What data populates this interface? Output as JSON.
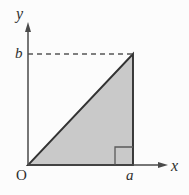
{
  "figure": {
    "kind": "right-triangle-coordinate-diagram",
    "background_color": "#fcfcfc",
    "labels": {
      "y_axis": "y",
      "x_axis": "x",
      "origin": "O",
      "height_tick": "b",
      "base_tick": "a"
    },
    "colors": {
      "axis": "#4a4a4a",
      "outline": "#333333",
      "fill": "#c9c9c9",
      "dashed": "#555555",
      "text": "#2e2e2e"
    },
    "geometry": {
      "origin_px": [
        28,
        165
      ],
      "base_vertex_px": [
        133,
        165
      ],
      "apex_vertex_px": [
        133,
        54
      ],
      "y_axis_top_px": [
        28,
        24
      ],
      "x_axis_right_px": [
        168,
        165
      ],
      "dashed_line_from_px": [
        28,
        54
      ],
      "dashed_line_to_px": [
        133,
        54
      ],
      "right_angle_marker_px": [
        115,
        147,
        18,
        18
      ]
    }
  }
}
